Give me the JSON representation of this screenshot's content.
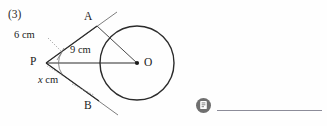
{
  "problem": {
    "number": "(3)"
  },
  "figure": {
    "type": "circle-with-two-tangents",
    "points": {
      "a": "A",
      "b": "B",
      "p": "P",
      "o": "O"
    },
    "measurements": {
      "tangent_pa": "6 cm",
      "radius_ao": "9 cm",
      "tangent_pb_prefix": "x",
      "tangent_pb_unit": " cm"
    }
  },
  "answer": {
    "icon": "note-icon",
    "value": ""
  },
  "colors": {
    "ink": "#1b1b1b",
    "stroke": "#2b2b2b",
    "leader": "#9a9a9a",
    "icon_bg": "#6f6f6f",
    "rule": "#8c8c99",
    "page_bg": "#fefefe"
  }
}
